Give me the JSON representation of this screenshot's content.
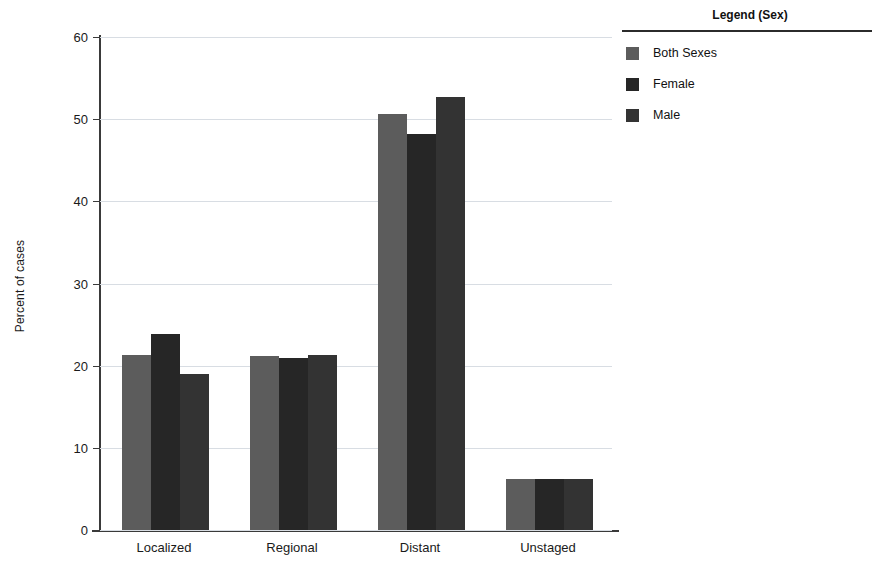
{
  "chart_data": {
    "type": "bar",
    "title": "",
    "subtitle": "",
    "xlabel": "",
    "ylabel": "Percent of cases",
    "categories": [
      "Localized",
      "Regional",
      "Distant",
      "Unstaged"
    ],
    "series": [
      {
        "name": "Both Sexes",
        "color": "#5c5c5c",
        "values": [
          21.3,
          21.2,
          50.6,
          6.2
        ]
      },
      {
        "name": "Female",
        "color": "#262626",
        "values": [
          23.9,
          20.9,
          48.2,
          6.2
        ]
      },
      {
        "name": "Male",
        "color": "#333333",
        "values": [
          19.0,
          21.3,
          52.7,
          6.2
        ]
      }
    ],
    "ylim": [
      0,
      60
    ],
    "yticks": [
      0,
      10,
      20,
      30,
      40,
      50,
      60
    ],
    "ytick_labels": [
      "0",
      "10",
      "20",
      "30",
      "40",
      "50",
      "60"
    ],
    "grid": true,
    "grid_color": "#d8dde3",
    "legend_position": "right",
    "legend": {
      "title": "Legend (Sex)",
      "entries": [
        "Both Sexes",
        "Female",
        "Male"
      ]
    }
  },
  "axis": {
    "y_title": "Percent of cases",
    "axis_color": "#3a3a3a"
  },
  "legend": {
    "title": "Legend (Sex)",
    "items": [
      {
        "label": "Both Sexes",
        "color": "#5c5c5c"
      },
      {
        "label": "Female",
        "color": "#262626"
      },
      {
        "label": "Male",
        "color": "#333333"
      }
    ]
  }
}
